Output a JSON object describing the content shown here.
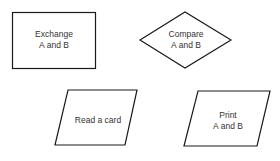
{
  "diagram": {
    "shapes": [
      {
        "id": "exchange",
        "type": "rectangle",
        "label_lines": [
          "Exchange",
          "A and B"
        ]
      },
      {
        "id": "compare",
        "type": "diamond",
        "label_lines": [
          "Compare",
          "A and B"
        ]
      },
      {
        "id": "read",
        "type": "parallelogram",
        "label_lines": [
          "Read a card"
        ]
      },
      {
        "id": "print",
        "type": "parallelogram",
        "label_lines": [
          "Print",
          "A and B"
        ]
      }
    ],
    "stroke_color": "#1a1a1a",
    "text_color": "#333333"
  }
}
